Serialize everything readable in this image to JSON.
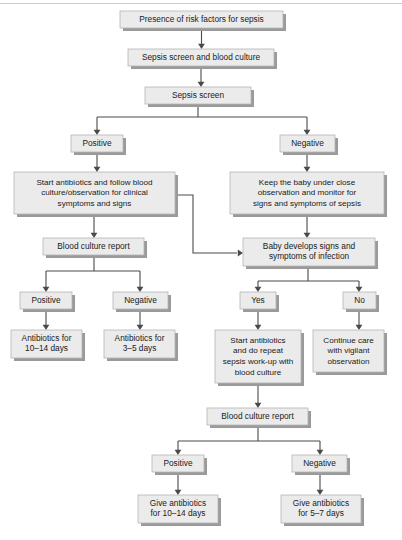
{
  "diagram": {
    "colors": {
      "node_fill": "#ebebeb",
      "node_border": "#b4b4b4",
      "node_shadow": "#9a9a9a",
      "edge": "#4a4a4a",
      "text": "#1a1a1a",
      "background": "#ffffff"
    },
    "nodes": [
      {
        "id": "risk-factors",
        "lines": [
          "Presence of risk factors for sepsis"
        ],
        "x": 120,
        "y": 11,
        "w": 163,
        "h": 17
      },
      {
        "id": "sepsis-screen-blood-culture",
        "lines": [
          "Sepsis screen and blood culture"
        ],
        "x": 128,
        "y": 49,
        "w": 146,
        "h": 17
      },
      {
        "id": "sepsis-screen",
        "lines": [
          "Sepsis screen"
        ],
        "x": 145,
        "y": 87,
        "w": 106,
        "h": 17
      },
      {
        "id": "screen-positive",
        "lines": [
          "Positive"
        ],
        "x": 71,
        "y": 135,
        "w": 52,
        "h": 17
      },
      {
        "id": "screen-negative",
        "lines": [
          "Negative"
        ],
        "x": 280,
        "y": 135,
        "w": 55,
        "h": 17
      },
      {
        "id": "start-antibiotics-follow",
        "lines": [
          "Start antibiotics and follow blood",
          "culture/observation for clinical",
          "symptoms and signs"
        ],
        "x": 14,
        "y": 172,
        "w": 161,
        "h": 42
      },
      {
        "id": "keep-baby-observation",
        "lines": [
          "Keep the baby under close",
          "observation and monitor for",
          "signs and symptoms of sepsis"
        ],
        "x": 230,
        "y": 172,
        "w": 154,
        "h": 42
      },
      {
        "id": "blood-culture-report-1",
        "lines": [
          "Blood culture report"
        ],
        "x": 43,
        "y": 238,
        "w": 101,
        "h": 17
      },
      {
        "id": "baby-develops-signs",
        "lines": [
          "Baby develops signs and",
          "symptoms of infection"
        ],
        "x": 243,
        "y": 238,
        "w": 132,
        "h": 28
      },
      {
        "id": "culture-positive",
        "lines": [
          "Positive"
        ],
        "x": 20,
        "y": 292,
        "w": 52,
        "h": 17
      },
      {
        "id": "culture-negative",
        "lines": [
          "Negative"
        ],
        "x": 113,
        "y": 292,
        "w": 55,
        "h": 17
      },
      {
        "id": "signs-yes",
        "lines": [
          "Yes"
        ],
        "x": 240,
        "y": 292,
        "w": 36,
        "h": 17
      },
      {
        "id": "signs-no",
        "lines": [
          "No"
        ],
        "x": 343,
        "y": 292,
        "w": 33,
        "h": 17
      },
      {
        "id": "antibiotics-10-14",
        "lines": [
          "Antibiotics for",
          "10–14 days"
        ],
        "x": 11,
        "y": 330,
        "w": 71,
        "h": 28
      },
      {
        "id": "antibiotics-3-5",
        "lines": [
          "Antibiotics for",
          "3–5 days"
        ],
        "x": 104,
        "y": 330,
        "w": 71,
        "h": 28
      },
      {
        "id": "start-antibiotics-repeat",
        "lines": [
          "Start antibiotics",
          "and do repeat",
          "sepsis work-up with",
          "blood culture"
        ],
        "x": 215,
        "y": 330,
        "w": 86,
        "h": 53
      },
      {
        "id": "continue-care",
        "lines": [
          "Continue care",
          "with vigilant",
          "observation"
        ],
        "x": 313,
        "y": 330,
        "w": 71,
        "h": 42
      },
      {
        "id": "blood-culture-report-2",
        "lines": [
          "Blood culture report"
        ],
        "x": 207,
        "y": 408,
        "w": 101,
        "h": 17
      },
      {
        "id": "final-positive",
        "lines": [
          "Positive"
        ],
        "x": 152,
        "y": 455,
        "w": 52,
        "h": 17
      },
      {
        "id": "final-negative",
        "lines": [
          "Negative"
        ],
        "x": 292,
        "y": 455,
        "w": 55,
        "h": 17
      },
      {
        "id": "give-antibiotics-10-14",
        "lines": [
          "Give antibiotics",
          "for 10–14 days"
        ],
        "x": 138,
        "y": 495,
        "w": 80,
        "h": 28
      },
      {
        "id": "give-antibiotics-5-7",
        "lines": [
          "Give antibiotics",
          "for 5–7 days"
        ],
        "x": 281,
        "y": 495,
        "w": 80,
        "h": 28
      }
    ],
    "edges": [
      {
        "id": "e-risk-to-screenculture",
        "path": "M201.5,28 L201.5,44",
        "arrow": "down",
        "ax": 201.5,
        "ay": 49
      },
      {
        "id": "e-screenculture-to-screen",
        "path": "M201,66 L201,82",
        "arrow": "down",
        "ax": 201,
        "ay": 87
      },
      {
        "id": "e-screen-split",
        "path": "M198,104 L198,117 M97,117 L307,117 M97,117 L97,130 M307,117 L307,130",
        "arrow": "none",
        "ax": 0,
        "ay": 0
      },
      {
        "id": "e-screen-to-positive",
        "path": "",
        "arrow": "down",
        "ax": 97,
        "ay": 135
      },
      {
        "id": "e-screen-to-negative",
        "path": "",
        "arrow": "down",
        "ax": 307,
        "ay": 135
      },
      {
        "id": "e-positive-to-start",
        "path": "M97,152 L97,167",
        "arrow": "down",
        "ax": 97,
        "ay": 172
      },
      {
        "id": "e-negative-to-keep",
        "path": "M307,152 L307,167",
        "arrow": "down",
        "ax": 307,
        "ay": 172
      },
      {
        "id": "e-start-to-culture-report",
        "path": "M94,214 L94,233",
        "arrow": "down",
        "ax": 94,
        "ay": 238
      },
      {
        "id": "e-keep-to-develops",
        "path": "M307,214 L307,233",
        "arrow": "down",
        "ax": 307,
        "ay": 238
      },
      {
        "id": "e-start-side-to-develops",
        "path": "M175,195 L193,195 L193,253 L237,253",
        "arrow": "right",
        "ax": 243,
        "ay": 253
      },
      {
        "id": "e-report1-split",
        "path": "M94,255 L94,271 M46,271 L140,271 M46,271 L46,287 M140,271 L140,287",
        "arrow": "none",
        "ax": 0,
        "ay": 0
      },
      {
        "id": "e-report1-to-pos",
        "path": "",
        "arrow": "down",
        "ax": 46,
        "ay": 292
      },
      {
        "id": "e-report1-to-neg",
        "path": "",
        "arrow": "down",
        "ax": 140,
        "ay": 292
      },
      {
        "id": "e-pos-to-ab1014",
        "path": "M46,309 L46,325",
        "arrow": "down",
        "ax": 46,
        "ay": 330
      },
      {
        "id": "e-neg-to-ab35",
        "path": "M140,309 L140,325",
        "arrow": "down",
        "ax": 140,
        "ay": 330
      },
      {
        "id": "e-develops-split",
        "path": "M308,266 L308,281 M258,281 L359,281 M258,281 L258,287 M359,281 L359,287",
        "arrow": "none",
        "ax": 0,
        "ay": 0
      },
      {
        "id": "e-develops-to-yes",
        "path": "",
        "arrow": "down",
        "ax": 258,
        "ay": 292
      },
      {
        "id": "e-develops-to-no",
        "path": "",
        "arrow": "down",
        "ax": 359,
        "ay": 292
      },
      {
        "id": "e-yes-to-start2",
        "path": "M258,309 L258,325",
        "arrow": "down",
        "ax": 258,
        "ay": 330
      },
      {
        "id": "e-no-to-continue",
        "path": "M359,309 L359,325",
        "arrow": "down",
        "ax": 359,
        "ay": 330
      },
      {
        "id": "e-start2-to-report2",
        "path": "M258,383 L258,403",
        "arrow": "down",
        "ax": 258,
        "ay": 408
      },
      {
        "id": "e-report2-split",
        "path": "M258,425 L258,441 M178,441 L320,441 M178,441 L178,450 M320,441 L320,450",
        "arrow": "none",
        "ax": 0,
        "ay": 0
      },
      {
        "id": "e-report2-to-pos",
        "path": "",
        "arrow": "down",
        "ax": 178,
        "ay": 455
      },
      {
        "id": "e-report2-to-neg",
        "path": "",
        "arrow": "down",
        "ax": 320,
        "ay": 455
      },
      {
        "id": "e-finalpos-to-give",
        "path": "M178,472 L178,490",
        "arrow": "down",
        "ax": 178,
        "ay": 495
      },
      {
        "id": "e-finalneg-to-give",
        "path": "M320,472 L320,490",
        "arrow": "down",
        "ax": 320,
        "ay": 495
      }
    ]
  }
}
